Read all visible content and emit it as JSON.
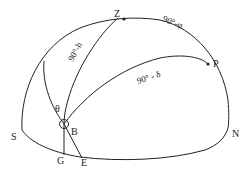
{
  "diagram": {
    "colors": {
      "ink": "#222222",
      "background": "#ffffff"
    },
    "points": {
      "zenith": {
        "label": "Z"
      },
      "pole": {
        "label": "P"
      },
      "body": {
        "label": "B"
      },
      "south": {
        "label": "S"
      },
      "north": {
        "label": "N"
      },
      "g": {
        "label": "G"
      },
      "e": {
        "label": "E"
      }
    },
    "arcs": {
      "zenith_to_body": {
        "label": "90°-h"
      },
      "zenith_to_pole": {
        "label": "90°-φ"
      },
      "pole_to_body": {
        "label": "90° - δ"
      }
    },
    "angle": {
      "label": "θ"
    }
  }
}
